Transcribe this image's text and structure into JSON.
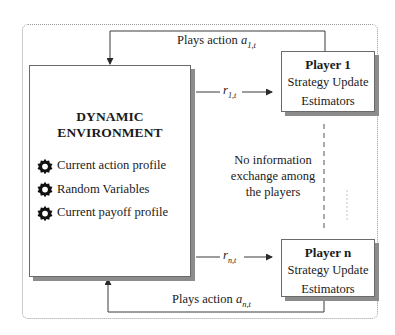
{
  "diagram": {
    "environment": {
      "title": "DYNAMIC ENVIRONMENT",
      "items": [
        {
          "icon": "gear-icon",
          "label": "Current action profile"
        },
        {
          "icon": "gear-icon",
          "label": "Random Variables"
        },
        {
          "icon": "gear-icon",
          "label": "Current payoff profile"
        }
      ]
    },
    "players": [
      {
        "title": "Player 1",
        "lines": [
          "Strategy Update",
          "Estimators"
        ]
      },
      {
        "title": "Player n",
        "lines": [
          "Strategy Update",
          "Estimators"
        ]
      }
    ],
    "edges": {
      "top_action": {
        "text": "Plays action ",
        "var": "a",
        "sub": "1,t"
      },
      "bottom_action": {
        "text": "Plays action ",
        "var": "a",
        "sub": "n,t"
      },
      "reward_1": {
        "var": "r",
        "sub": "1,t"
      },
      "reward_n": {
        "var": "r",
        "sub": "n,t"
      }
    },
    "note": {
      "lines": [
        "No information",
        "exchange among",
        "the players"
      ]
    },
    "colors": {
      "line": "#3a3a3a",
      "shadow": "#8c8c8c",
      "outer_border": "#9a9a9a"
    }
  }
}
